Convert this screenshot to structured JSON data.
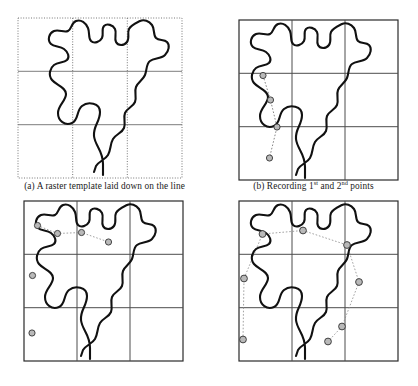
{
  "figure": {
    "panel_count": 4,
    "background_color": "#ffffff"
  },
  "style": {
    "curve_color": "#111111",
    "curve_width": 2.1,
    "grid_solid_color": "#4d4d4d",
    "grid_dotted_color": "#777777",
    "marker_fill": "#b9b9b9",
    "marker_stroke": "#333333",
    "marker_radius": 3.1,
    "connector_color": "#8a8a8a",
    "caption_color": "#1a1a1a"
  },
  "panels": [
    {
      "id": "a",
      "label": "a",
      "caption_prefix": "(a) ",
      "caption": "(a) A raster template laid down on the line",
      "caption_main": "A raster template laid down on the line",
      "grid": {
        "style": "dotted",
        "border_style": "dotted",
        "columns": 3,
        "rows": 3,
        "x0": 18,
        "y0": 18,
        "x1": 182,
        "y1": 178,
        "interior_horizontal_style": "solid",
        "interior_vertical_style": "dotted"
      },
      "markers": [],
      "connectors": []
    },
    {
      "id": "b",
      "label": "b",
      "caption_prefix": "(b) ",
      "caption": "(b) Recording 1st and 2nd points",
      "caption_pre": "(b) Recording 1",
      "caption_sup1": "st",
      "caption_mid": " and 2",
      "caption_sup2": "nd",
      "caption_post": " points",
      "grid": {
        "style": "solid",
        "border_style": "solid",
        "columns": 3,
        "rows": 3,
        "x0": 30,
        "y0": 20,
        "x1": 189,
        "y1": 180
      },
      "marker_count": 4,
      "markers": [
        {
          "x": 54.0,
          "y": 75.5
        },
        {
          "x": 61.5,
          "y": 100.0
        },
        {
          "x": 68.0,
          "y": 127.0
        },
        {
          "x": 60.5,
          "y": 158.0
        }
      ],
      "connectors": [
        {
          "from": 0,
          "to": 1
        },
        {
          "from": 1,
          "to": 2
        },
        {
          "from": 2,
          "to": 3
        }
      ]
    },
    {
      "id": "c",
      "label": "c",
      "caption": "",
      "grid": {
        "style": "solid",
        "border_style": "solid",
        "columns": 3,
        "rows": 3,
        "x0": 24,
        "y0": 8,
        "x1": 183,
        "y1": 168
      },
      "marker_count": 6,
      "markers": [
        {
          "x": 57.5,
          "y": 40.5
        },
        {
          "x": 37.5,
          "y": 32.5
        },
        {
          "x": 81.5,
          "y": 39.5
        },
        {
          "x": 108.5,
          "y": 49.0
        },
        {
          "x": 32.5,
          "y": 82.5
        },
        {
          "x": 32.0,
          "y": 140.0
        }
      ],
      "connectors": [
        {
          "from": 1,
          "to": 0
        },
        {
          "from": 0,
          "to": 2
        },
        {
          "from": 2,
          "to": 3
        }
      ]
    },
    {
      "id": "d",
      "label": "d",
      "caption": "",
      "grid": {
        "style": "solid",
        "border_style": "solid",
        "columns": 3,
        "rows": 3,
        "x0": 30,
        "y0": 8,
        "x1": 189,
        "y1": 168
      },
      "marker_count": 8,
      "markers": [
        {
          "x": 53.5,
          "y": 41.0
        },
        {
          "x": 94.0,
          "y": 37.5
        },
        {
          "x": 138.0,
          "y": 52.0
        },
        {
          "x": 35.0,
          "y": 85.5
        },
        {
          "x": 150.0,
          "y": 89.0
        },
        {
          "x": 133.0,
          "y": 133.5
        },
        {
          "x": 119.0,
          "y": 148.5
        },
        {
          "x": 34.0,
          "y": 146.5
        }
      ],
      "connectors": [
        {
          "from": 0,
          "to": 1
        },
        {
          "from": 1,
          "to": 2
        },
        {
          "from": 2,
          "to": 4
        },
        {
          "from": 4,
          "to": 5
        },
        {
          "from": 5,
          "to": 6
        },
        {
          "from": 0,
          "to": 3
        },
        {
          "from": 3,
          "to": 7
        }
      ]
    }
  ],
  "curve": {
    "description": "Irregular coastline-like meandering line, identical shape in all four panels",
    "path_a": "M 103 175 L 103 164 C 103 150 95 146 94 136 C 93 126 100 122 100 112 C 100 103 88 101 82 106 C 76 111 79 120 72 123 C 65 126 58 121 58 113 C 58 105 66 101 66 94 C 66 87 56 85 52 80 C 48 75 50 68 54 65 C 58 62 64 63 67 60 C 70 57 68 52 64 49 C 60 46 54 47 51 44 C 47 40 49 33 54 31 C 59 29 64 33 68 31 C 72 29 71 23 76 21 C 81 19 86 23 88 28 C 90 33 88 38 91 41 C 94 44 100 42 102 38 C 104 34 101 29 104 26 C 107 23 113 25 115 29 C 117 33 114 38 116 42 C 118 46 124 46 127 42 C 130 38 127 33 129 29 C 131 25 136 23 140 21 C 144 19 149 21 152 25 C 155 29 153 35 156 38 C 159 41 164 39 167 42 C 170 45 169 51 165 55 C 161 59 154 58 150 61 C 146 64 147 70 145 75 C 143 80 138 82 136 87 C 134 92 137 97 135 102 C 133 107 127 108 125 113 C 123 118 126 123 124 128 C 122 133 116 134 113 139 C 110 144 111 150 108 155 C 105 160 99 161 96 166 L 94 172",
    "path_main": "M 96 178 L 96 167 C 96 153 88 149 87 139 C 86 129 93 125 93 115 C 93 106 81 104 75 109 C 69 114 72 123 65 126 C 58 129 51 124 51 116 C 51 108 59 104 59 97 C 59 90 49 88 45 83 C 41 78 43 71 47 68 C 51 65 57 66 60 63 C 63 60 61 55 57 52 C 53 49 47 50 44 47 C 40 43 42 36 47 34 C 52 32 57 36 61 34 C 65 32 64 26 69 24 C 74 22 79 26 81 31 C 83 36 81 41 84 44 C 87 47 93 45 95 41 C 97 37 94 32 97 29 C 100 26 106 28 108 32 C 110 36 107 41 109 45 C 111 49 117 49 120 45 C 123 41 120 36 122 32 C 124 28 129 26 133 24 C 137 22 142 24 145 28 C 148 32 146 38 149 41 C 152 44 157 42 160 45 C 163 48 162 54 158 58 C 154 62 147 61 143 64 C 139 67 140 73 138 78 C 136 83 131 85 129 90 C 127 95 130 100 128 105 C 126 110 120 111 118 116 C 116 121 119 126 117 131 C 115 136 109 137 106 142 C 103 147 104 153 101 158 C 98 163 92 164 89 169 L 87 175"
  },
  "grid_geometry": {
    "columns": 3,
    "rows": 3,
    "cell_fraction_x": [
      0.0,
      0.3333,
      0.6667,
      1.0
    ],
    "cell_fraction_y": [
      0.0,
      0.3333,
      0.6667,
      1.0
    ]
  }
}
